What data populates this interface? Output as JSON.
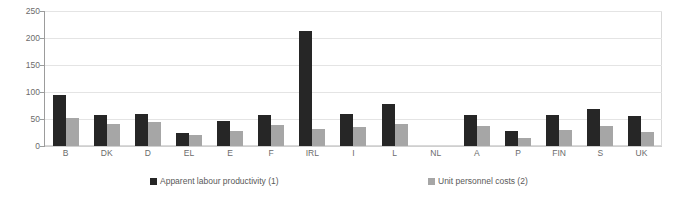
{
  "chart_data": {
    "type": "bar",
    "title": "",
    "xlabel": "",
    "ylabel": "",
    "ylim": [
      0,
      250
    ],
    "yticks": [
      0,
      50,
      100,
      150,
      200,
      250
    ],
    "grid": true,
    "legend_position": "bottom",
    "categories": [
      "B",
      "DK",
      "D",
      "EL",
      "E",
      "F",
      "IRL",
      "I",
      "L",
      "NL",
      "A",
      "P",
      "FIN",
      "S",
      "UK"
    ],
    "series": [
      {
        "name": "Apparent labour productivity (1)",
        "color": "#262626",
        "values": [
          94,
          58,
          59,
          24,
          47,
          58,
          213,
          59,
          77,
          null,
          57,
          28,
          58,
          68,
          55
        ]
      },
      {
        "name": "Unit personnel costs (2)",
        "color": "#a6a6a6",
        "values": [
          52,
          40,
          45,
          20,
          28,
          38,
          31,
          35,
          40,
          null,
          37,
          14,
          30,
          37,
          26
        ]
      }
    ]
  },
  "axis": {
    "y_tick_labels": [
      "0",
      "50",
      "100",
      "150",
      "200",
      "250"
    ]
  },
  "legend": {
    "items": [
      {
        "label": "Apparent labour productivity (1)",
        "color": "#262626"
      },
      {
        "label": "Unit personnel costs (2)",
        "color": "#a6a6a6"
      }
    ]
  }
}
